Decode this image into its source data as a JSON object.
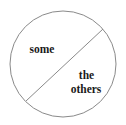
{
  "diagram": {
    "shape": "circle",
    "divider": "diagonal-line",
    "regions": [
      {
        "id": "upper-left",
        "label": "some"
      },
      {
        "id": "lower-right",
        "label_lines": [
          "the",
          "others"
        ]
      }
    ],
    "colors": {
      "stroke": "#8a8a8a",
      "text": "#1a1a1a",
      "background": "#ffffff"
    }
  }
}
